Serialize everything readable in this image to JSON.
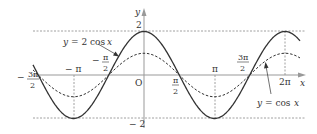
{
  "chart_data": {
    "type": "line",
    "title": "",
    "xlabel": "x",
    "ylabel": "y",
    "origin_label": "O",
    "xlim": [
      -4.85,
      7.0
    ],
    "ylim": [
      -2,
      2
    ],
    "grid": false,
    "guide_lines": {
      "horizontal": [
        2,
        -2
      ],
      "vertical": [
        "-π",
        "π",
        "2π"
      ]
    },
    "x_tick_labels": [
      {
        "value": "-3π/2",
        "text_sign": "−",
        "num": "3π",
        "den": "2"
      },
      {
        "value": "-π",
        "text": "− π"
      },
      {
        "value": "-π/2",
        "text_sign": "−",
        "num": "π",
        "den": "2"
      },
      {
        "value": "π/2",
        "num": "π",
        "den": "2"
      },
      {
        "value": "π",
        "text": "π"
      },
      {
        "value": "3π/2",
        "num": "3π",
        "den": "2"
      },
      {
        "value": "2π",
        "text": "2π"
      }
    ],
    "y_tick_labels": [
      {
        "value": 2,
        "text": "2"
      },
      {
        "value": -2,
        "text": "− 2"
      }
    ],
    "series": [
      {
        "name": "y = 2 cos x",
        "style": "solid",
        "amplitude": 2,
        "function": "2cos(x)"
      },
      {
        "name": "y = cos x",
        "style": "dashed",
        "amplitude": 1,
        "function": "cos(x)"
      }
    ],
    "annotations": [
      {
        "text": "y = 2 cos x",
        "points_to": "solid curve near x = -π/2"
      },
      {
        "text": "y = cos x",
        "points_to": "dashed curve near x = 5π/3"
      }
    ]
  },
  "labels": {
    "y_axis": "y",
    "x_axis": "x",
    "origin": "O",
    "y_top": "2",
    "y_bottom": "− 2",
    "neg_pi": "− π",
    "pi": "π",
    "two_pi": "2π",
    "minus": "−",
    "pi_num": "π",
    "three_pi_num": "3π",
    "den": "2",
    "curve_2cos_y": "y",
    "curve_2cos_eq": "= 2 cos",
    "curve_2cos_x": "x",
    "curve_cos_y": "y",
    "curve_cos_eq": "= cos",
    "curve_cos_x": "x"
  },
  "colors": {
    "axis": "#999999",
    "curve": "#333333",
    "guide": "#888888",
    "text": "#333333"
  }
}
